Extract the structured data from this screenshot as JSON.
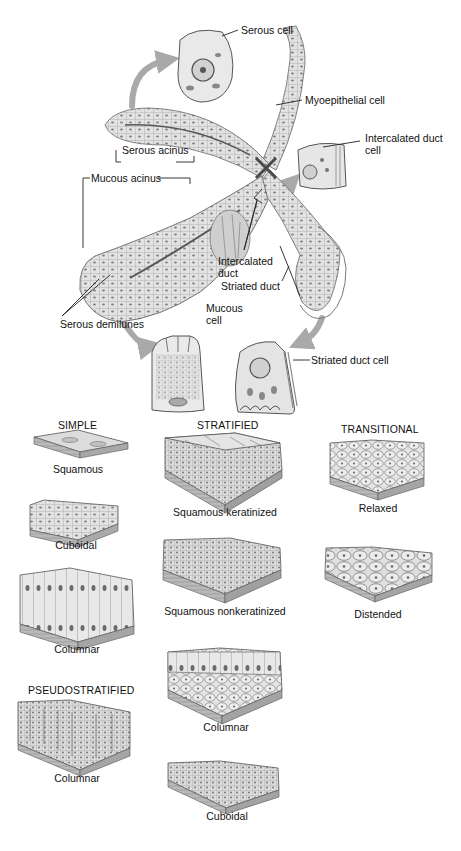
{
  "gland": {
    "labels": {
      "serous_cell": "Serous cell",
      "myoepithelial_cell": "Myoepithelial cell",
      "intercalated_duct_cell_line1": "Intercalated duct",
      "intercalated_duct_cell_line2": "cell",
      "serous_acinus": "Serous acinus",
      "mucous_acinus": "Mucous acinus",
      "intercalated_duct_line1": "Intercalated",
      "intercalated_duct_line2": "duct",
      "striated_duct": "Striated duct",
      "mucous_cell_line1": "Mucous",
      "mucous_cell_line2": "cell",
      "serous_demilunes": "Serous demilunes",
      "striated_duct_cell": "Striated duct cell"
    }
  },
  "epithelia": {
    "simple": {
      "heading": "SIMPLE",
      "items": [
        {
          "caption": "Squamous"
        },
        {
          "caption": "Cuboidal"
        },
        {
          "caption": "Columnar"
        }
      ]
    },
    "pseudostratified": {
      "heading": "PSEUDOSTRATIFIED",
      "items": [
        {
          "caption": "Columnar"
        }
      ]
    },
    "stratified": {
      "heading": "STRATIFIED",
      "items": [
        {
          "caption": "Squamous keratinized"
        },
        {
          "caption": "Squamous nonkeratinized"
        },
        {
          "caption": "Columnar"
        },
        {
          "caption": "Cuboidal"
        }
      ]
    },
    "transitional": {
      "heading": "TRANSITIONAL",
      "items": [
        {
          "caption": "Relaxed"
        },
        {
          "caption": "Distended"
        }
      ]
    }
  },
  "colors": {
    "tissue_light": "#e6e6e6",
    "tissue_mid": "#bdbdbd",
    "tissue_dark": "#7a7a7a",
    "line": "#333333",
    "arrow": "#a9a9a9"
  }
}
